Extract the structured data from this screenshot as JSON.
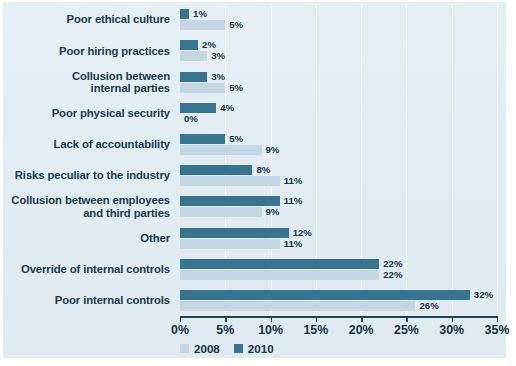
{
  "chart_data": {
    "type": "bar",
    "orientation": "horizontal",
    "title": "",
    "xlabel": "",
    "ylabel": "",
    "xlim": [
      0,
      35
    ],
    "xtick_labels": [
      "0%",
      "5%",
      "10%",
      "15%",
      "20%",
      "25%",
      "30%",
      "35%"
    ],
    "xticks": [
      0,
      5,
      10,
      15,
      20,
      25,
      30,
      35
    ],
    "grid": true,
    "legend_position": "bottom-left",
    "categories": [
      "Poor ethical culture",
      "Poor hiring practices",
      "Collusion between internal parties",
      "Poor physical security",
      "Lack of accountability",
      "Risks peculiar to the industry",
      "Collusion between employees and third parties",
      "Other",
      "Override of internal controls",
      "Poor internal controls"
    ],
    "category_lines": [
      [
        "Poor ethical culture"
      ],
      [
        "Poor hiring practices"
      ],
      [
        "Collusion between",
        "internal parties"
      ],
      [
        "Poor physical security"
      ],
      [
        "Lack of accountability"
      ],
      [
        "Risks peculiar to the industry"
      ],
      [
        "Collusion between employees",
        "and third parties"
      ],
      [
        "Other"
      ],
      [
        "Override of internal controls"
      ],
      [
        "Poor internal controls"
      ]
    ],
    "series": [
      {
        "name": "2010",
        "color": "#36748f",
        "values": [
          1,
          2,
          3,
          4,
          5,
          8,
          11,
          12,
          22,
          32
        ],
        "value_labels": [
          "1%",
          "2%",
          "3%",
          "4%",
          "5%",
          "8%",
          "11%",
          "12%",
          "22%",
          "32%"
        ]
      },
      {
        "name": "2008",
        "color": "#c3d6e2",
        "values": [
          5,
          3,
          5,
          0,
          9,
          11,
          9,
          11,
          22,
          26
        ],
        "value_labels": [
          "5%",
          "3%",
          "5%",
          "0%",
          "9%",
          "11%",
          "9%",
          "11%",
          "22%",
          "26%"
        ]
      }
    ]
  },
  "legend": {
    "items": [
      {
        "label": "2008",
        "color": "#c3d6e2"
      },
      {
        "label": "2010",
        "color": "#36748f"
      }
    ]
  }
}
